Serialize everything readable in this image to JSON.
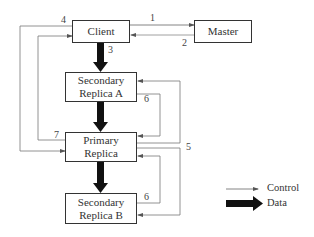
{
  "diagram": {
    "nodes": {
      "client": "Client",
      "master": "Master",
      "secondary_a": "Secondary Replica A",
      "secondary_a_line1": "Secondary",
      "secondary_a_line2": "Replica A",
      "primary_line1": "Primary",
      "primary_line2": "Replica",
      "secondary_b_line1": "Secondary",
      "secondary_b_line2": "Replica B"
    },
    "edge_labels": {
      "e1": "1",
      "e2": "2",
      "e3": "3",
      "e4": "4",
      "e5": "5",
      "e6a": "6",
      "e6b": "6",
      "e7": "7"
    },
    "edges": [
      {
        "label": "1",
        "from": "Client",
        "to": "Master",
        "type": "control"
      },
      {
        "label": "2",
        "from": "Master",
        "to": "Client",
        "type": "control"
      },
      {
        "label": "3",
        "from": "Client",
        "to": "Secondary Replica A",
        "type": "data"
      },
      {
        "label": "",
        "from": "Secondary Replica A",
        "to": "Primary Replica",
        "type": "data"
      },
      {
        "label": "",
        "from": "Primary Replica",
        "to": "Secondary Replica B",
        "type": "data"
      },
      {
        "label": "4",
        "from": "Client",
        "to": "Primary Replica",
        "type": "control"
      },
      {
        "label": "5",
        "from": "Primary Replica",
        "to": "Secondary Replica A / Secondary Replica B",
        "type": "control"
      },
      {
        "label": "6",
        "from": "Secondary Replica A",
        "to": "Primary Replica",
        "type": "control"
      },
      {
        "label": "6",
        "from": "Secondary Replica B",
        "to": "Primary Replica",
        "type": "control"
      },
      {
        "label": "7",
        "from": "Primary Replica",
        "to": "Client",
        "type": "control"
      }
    ],
    "legend": {
      "control": "Control",
      "data": "Data"
    },
    "colors": {
      "line": "#666666",
      "data_arrow": "#111111",
      "box_border": "#333333"
    }
  }
}
